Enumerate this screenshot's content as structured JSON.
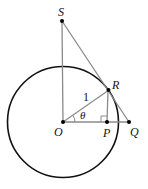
{
  "diagram": {
    "type": "unit-circle-trig",
    "labels": {
      "S": "S",
      "R": "R",
      "O": "O",
      "P": "P",
      "Q": "Q",
      "radius": "1",
      "angle": "θ"
    },
    "colors": {
      "circle": "#111111",
      "segments": "#8a8a8a",
      "points": "#000000"
    },
    "points": {
      "O": [
        63,
        122
      ],
      "P": [
        107,
        122
      ],
      "Q": [
        129,
        122
      ],
      "R": [
        109,
        90
      ],
      "S": [
        62,
        21
      ]
    },
    "circle": {
      "cx": 63,
      "cy": 122,
      "r": 56
    }
  }
}
